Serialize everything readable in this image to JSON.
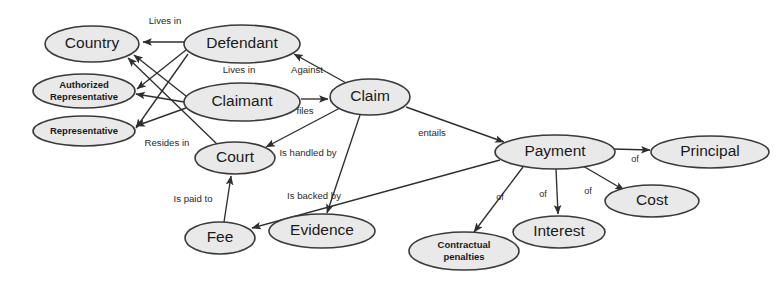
{
  "diagram": {
    "type": "concept-map",
    "background_color": "#ffffff",
    "node_fill_color": "#e9e9e9",
    "node_stroke_color": "#3a3a3a",
    "edge_color": "#2e2e2e",
    "nodes": [
      {
        "id": "country",
        "label": "Country",
        "cx": 92,
        "cy": 44,
        "rx": 47,
        "ry": 18,
        "style": "big"
      },
      {
        "id": "authrep",
        "label": "Authorized\nRepresentative",
        "line1": "Authorized",
        "line2": "Representative",
        "cx": 84,
        "cy": 91,
        "rx": 51,
        "ry": 17,
        "style": "small-bold"
      },
      {
        "id": "rep",
        "label": "Representative",
        "cx": 84,
        "cy": 131,
        "rx": 51,
        "ry": 15,
        "style": "small-bold"
      },
      {
        "id": "defendant",
        "label": "Defendant",
        "cx": 242,
        "cy": 44,
        "rx": 58,
        "ry": 19,
        "style": "big"
      },
      {
        "id": "claimant",
        "label": "Claimant",
        "cx": 242,
        "cy": 102,
        "rx": 58,
        "ry": 19,
        "style": "big"
      },
      {
        "id": "claim",
        "label": "Claim",
        "cx": 370,
        "cy": 97,
        "rx": 40,
        "ry": 18,
        "style": "big"
      },
      {
        "id": "court",
        "label": "Court",
        "cx": 235,
        "cy": 158,
        "rx": 40,
        "ry": 16,
        "style": "big"
      },
      {
        "id": "fee",
        "label": "Fee",
        "cx": 220,
        "cy": 238,
        "rx": 35,
        "ry": 16,
        "style": "big"
      },
      {
        "id": "evidence",
        "label": "Evidence",
        "cx": 322,
        "cy": 231,
        "rx": 53,
        "ry": 17,
        "style": "big"
      },
      {
        "id": "payment",
        "label": "Payment",
        "cx": 555,
        "cy": 152,
        "rx": 60,
        "ry": 17,
        "style": "big"
      },
      {
        "id": "principal",
        "label": "Principal",
        "cx": 710,
        "cy": 152,
        "rx": 59,
        "ry": 16,
        "style": "big"
      },
      {
        "id": "cost",
        "label": "Cost",
        "cx": 652,
        "cy": 201,
        "rx": 47,
        "ry": 16,
        "style": "big"
      },
      {
        "id": "interest",
        "label": "Interest",
        "cx": 559,
        "cy": 232,
        "rx": 46,
        "ry": 16,
        "style": "big"
      },
      {
        "id": "contractual",
        "label": "Contractual\npenalties",
        "line1": "Contractual",
        "line2": "penalties",
        "cx": 464,
        "cy": 251,
        "rx": 55,
        "ry": 19,
        "style": "small-bold"
      }
    ],
    "edges": [
      {
        "id": "defendant-country",
        "from": "Defendant",
        "to": "Country",
        "label": "Lives in",
        "label_x": 165,
        "label_y": 21,
        "x1": 184,
        "y1": 42,
        "x2": 143,
        "y2": 42
      },
      {
        "id": "defendant-authrep",
        "from": "Defendant",
        "to": "Authorized Representative",
        "label": "",
        "label_x": 0,
        "label_y": 0,
        "x1": 186,
        "y1": 50,
        "x2": 137,
        "y2": 89
      },
      {
        "id": "defendant-rep",
        "from": "Defendant",
        "to": "Representative",
        "label": "",
        "label_x": 0,
        "label_y": 0,
        "x1": 188,
        "y1": 54,
        "x2": 136,
        "y2": 128
      },
      {
        "id": "claimant-country",
        "from": "Claimant",
        "to": "Country",
        "label": "Lives in",
        "label_x": 239,
        "label_y": 70,
        "x1": 186,
        "y1": 96,
        "x2": 134,
        "y2": 55
      },
      {
        "id": "claimant-authrep",
        "from": "Claimant",
        "to": "Authorized Representative",
        "label": "",
        "label_x": 0,
        "label_y": 0,
        "x1": 184,
        "y1": 102,
        "x2": 136,
        "y2": 94
      },
      {
        "id": "claimant-rep",
        "from": "Claimant",
        "to": "Representative",
        "label": "",
        "label_x": 0,
        "label_y": 0,
        "x1": 186,
        "y1": 108,
        "x2": 136,
        "y2": 126
      },
      {
        "id": "court-country",
        "from": "Court",
        "to": "Country",
        "label": "Resides in",
        "label_x": 167,
        "label_y": 143,
        "x1": 218,
        "y1": 145,
        "x2": 128,
        "y2": 58
      },
      {
        "id": "claim-defendant",
        "from": "Claim",
        "to": "Defendant",
        "label": "Against",
        "label_x": 307,
        "label_y": 70,
        "x1": 348,
        "y1": 84,
        "x2": 294,
        "y2": 54
      },
      {
        "id": "claimant-claim",
        "from": "Claimant",
        "to": "Claim",
        "label": "files",
        "label_x": 305,
        "label_y": 111,
        "x1": 301,
        "y1": 99,
        "x2": 328,
        "y2": 99
      },
      {
        "id": "claim-court",
        "from": "Claim",
        "to": "Court",
        "label": "Is handled by",
        "label_x": 308,
        "label_y": 153,
        "x1": 340,
        "y1": 108,
        "x2": 266,
        "y2": 147
      },
      {
        "id": "claim-evidence",
        "from": "Claim",
        "to": "Evidence",
        "label": "Is backed by",
        "label_x": 314,
        "label_y": 196,
        "x1": 360,
        "y1": 115,
        "x2": 327,
        "y2": 213
      },
      {
        "id": "claim-payment",
        "from": "Claim",
        "to": "Payment",
        "label": "entails",
        "label_x": 432,
        "label_y": 133,
        "x1": 406,
        "y1": 107,
        "x2": 504,
        "y2": 142
      },
      {
        "id": "payment-fee",
        "from": "Payment",
        "to": "Fee",
        "label": "",
        "label_x": 0,
        "label_y": 0,
        "x1": 500,
        "y1": 160,
        "x2": 252,
        "y2": 228
      },
      {
        "id": "fee-court",
        "from": "Fee",
        "to": "Court",
        "label": "Is paid to",
        "label_x": 193,
        "label_y": 199,
        "x1": 224,
        "y1": 222,
        "x2": 231,
        "y2": 176
      },
      {
        "id": "payment-contractual",
        "from": "Payment",
        "to": "Contractual penalties",
        "label": "of",
        "label_x": 500,
        "label_y": 198,
        "x1": 523,
        "y1": 167,
        "x2": 474,
        "y2": 232
      },
      {
        "id": "payment-interest",
        "from": "Payment",
        "to": "Interest",
        "label": "of",
        "label_x": 543,
        "label_y": 195,
        "x1": 556,
        "y1": 169,
        "x2": 558,
        "y2": 214
      },
      {
        "id": "payment-cost",
        "from": "Payment",
        "to": "Cost",
        "label": "of",
        "label_x": 588,
        "label_y": 192,
        "x1": 583,
        "y1": 166,
        "x2": 624,
        "y2": 190
      },
      {
        "id": "payment-principal",
        "from": "Payment",
        "to": "Principal",
        "label": "of",
        "label_x": 635,
        "label_y": 160,
        "x1": 613,
        "y1": 149,
        "x2": 650,
        "y2": 150
      }
    ]
  }
}
